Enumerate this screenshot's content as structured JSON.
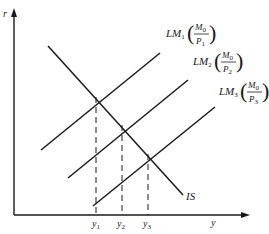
{
  "diagram": {
    "type": "IS-LM",
    "axes": {
      "x_label": "y",
      "y_label": "r"
    },
    "curves": [
      {
        "name": "IS",
        "label": "IS"
      },
      {
        "name": "LM1",
        "label_main": "LM",
        "label_sub": "1",
        "frac_num": "M",
        "frac_num_sub": "0",
        "frac_den": "P",
        "frac_den_sub": "1"
      },
      {
        "name": "LM2",
        "label_main": "LM",
        "label_sub": "2",
        "frac_num": "M",
        "frac_num_sub": "0",
        "frac_den": "P",
        "frac_den_sub": "2"
      },
      {
        "name": "LM3",
        "label_main": "LM",
        "label_sub": "3",
        "frac_num": "M",
        "frac_num_sub": "0",
        "frac_den": "P",
        "frac_den_sub": "3"
      }
    ],
    "equilibria": [
      {
        "label_main": "y",
        "label_sub": "1"
      },
      {
        "label_main": "y",
        "label_sub": "2"
      },
      {
        "label_main": "y",
        "label_sub": "3"
      }
    ],
    "colors": {
      "line": "#1a1a1a",
      "background": "#ffffff"
    }
  }
}
